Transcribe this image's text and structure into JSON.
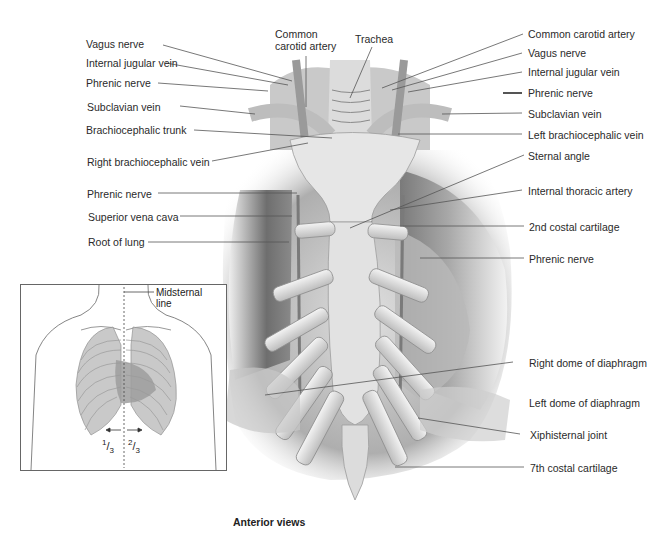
{
  "figure": {
    "caption": "Anterior views",
    "top_labels": {
      "common_carotid_artery": "Common\ncarotid artery",
      "trachea": "Trachea"
    },
    "left_labels": [
      {
        "id": "vagus-nerve-left",
        "text": "Vagus nerve"
      },
      {
        "id": "internal-jugular-vein-left",
        "text": "Internal jugular vein"
      },
      {
        "id": "phrenic-nerve-left-upper",
        "text": "Phrenic nerve"
      },
      {
        "id": "subclavian-vein-left",
        "text": "Subclavian vein"
      },
      {
        "id": "brachiocephalic-trunk",
        "text": "Brachiocephalic trunk"
      },
      {
        "id": "right-brachiocephalic-vein",
        "text": "Right brachiocephalic vein"
      },
      {
        "id": "phrenic-nerve-left-lower",
        "text": "Phrenic nerve"
      },
      {
        "id": "superior-vena-cava",
        "text": "Superior vena cava"
      },
      {
        "id": "root-of-lung",
        "text": "Root of lung"
      }
    ],
    "right_labels": [
      {
        "id": "common-carotid-artery-right",
        "text": "Common carotid artery"
      },
      {
        "id": "vagus-nerve-right",
        "text": "Vagus nerve"
      },
      {
        "id": "internal-jugular-vein-right",
        "text": "Internal jugular vein"
      },
      {
        "id": "phrenic-nerve-right-upper",
        "text": "Phrenic nerve"
      },
      {
        "id": "subclavian-vein-right",
        "text": "Subclavian vein"
      },
      {
        "id": "left-brachiocephalic-vein",
        "text": "Left brachiocephalic vein"
      },
      {
        "id": "sternal-angle",
        "text": "Sternal angle"
      },
      {
        "id": "internal-thoracic-artery",
        "text": "Internal thoracic artery"
      },
      {
        "id": "2nd-costal-cartilage",
        "text": "2nd costal cartilage"
      },
      {
        "id": "phrenic-nerve-right-lower",
        "text": "Phrenic nerve"
      },
      {
        "id": "right-dome-of-diaphragm",
        "text": "Right dome of diaphragm"
      },
      {
        "id": "left-dome-of-diaphragm",
        "text": "Left dome of diaphragm"
      },
      {
        "id": "xiphisternal-joint",
        "text": "Xiphisternal joint"
      },
      {
        "id": "7th-costal-cartilage",
        "text": "7th costal cartilage"
      }
    ],
    "inset": {
      "midsternal_line": "Midsternal\nline",
      "fraction_left": {
        "num": "1",
        "den": "3"
      },
      "fraction_right": {
        "num": "2",
        "den": "3"
      }
    }
  }
}
